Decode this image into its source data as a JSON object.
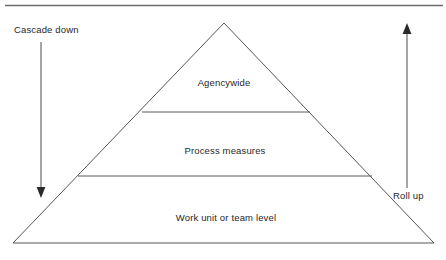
{
  "figure": {
    "type": "pyramid-hierarchy-diagram",
    "background_color": "#ffffff",
    "line_color": "#555555",
    "text_color": "#1f1f1f"
  },
  "top_rule": {
    "name": "top-horizontal-rule"
  },
  "pyramid": {
    "apex_label": "pyramid-apex",
    "bands": [
      {
        "id": "band-top",
        "label": "Agencywide",
        "label_x": 224,
        "label_y": 86
      },
      {
        "id": "band-middle",
        "label": "Process measures",
        "label_x": 225,
        "label_y": 154
      },
      {
        "id": "band-bottom",
        "label": "Work unit or team level",
        "label_x": 226,
        "label_y": 221
      }
    ],
    "divider_top": {
      "name": "divider-line-upper",
      "x1": 142,
      "y1": 112,
      "x2": 310,
      "y2": 112
    },
    "divider_bottom": {
      "name": "divider-line-lower",
      "x1": 78,
      "y1": 176,
      "x2": 372,
      "y2": 176
    },
    "outline": {
      "apex_x": 224,
      "apex_y": 23,
      "base_left_x": 13,
      "base_right_x": 434,
      "base_y": 243
    }
  },
  "annotations": {
    "left": {
      "label": "Cascade down",
      "direction": "down",
      "label_x": 14,
      "label_y": 33,
      "shaft_x": 41,
      "shaft_y1": 42,
      "shaft_y2": 190,
      "arrow_tip_y": 198
    },
    "right": {
      "label": "Roll up",
      "direction": "up",
      "label_x": 393,
      "label_y": 199,
      "shaft_x": 407,
      "shaft_y1": 188,
      "shaft_y2": 32,
      "arrow_tip_y": 23
    }
  }
}
